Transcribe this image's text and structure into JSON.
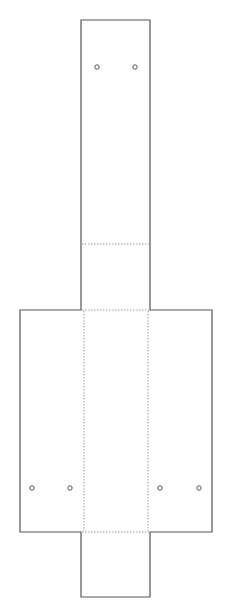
{
  "canvas": {
    "width": 234,
    "height": 606,
    "background": "#ffffff"
  },
  "colors": {
    "cut_line": "#555555",
    "fold_line": "#9a9a9a",
    "hole": "#555555"
  },
  "diagram": {
    "type": "dieline-template",
    "outline_cut_path": [
      [
        81,
        20
      ],
      [
        150,
        20
      ],
      [
        150,
        310
      ],
      [
        212,
        310
      ],
      [
        212,
        532
      ],
      [
        150,
        532
      ],
      [
        150,
        597
      ],
      [
        81,
        597
      ],
      [
        81,
        532
      ],
      [
        20,
        532
      ],
      [
        20,
        310
      ],
      [
        81,
        310
      ]
    ],
    "fold_lines": [
      {
        "name": "fold-top-panel",
        "x1": 82,
        "y1": 244,
        "x2": 149,
        "y2": 244
      },
      {
        "name": "fold-upper-crossbar",
        "x1": 82,
        "y1": 310,
        "x2": 149,
        "y2": 310
      },
      {
        "name": "fold-lower-crossbar",
        "x1": 82,
        "y1": 532,
        "x2": 149,
        "y2": 532
      },
      {
        "name": "fold-left-vertical",
        "x1": 84,
        "y1": 311,
        "x2": 84,
        "y2": 531
      },
      {
        "name": "fold-right-vertical",
        "x1": 148,
        "y1": 311,
        "x2": 148,
        "y2": 531
      }
    ],
    "holes": [
      {
        "name": "hole-top-left",
        "cx": 97,
        "cy": 67,
        "r": 2.2
      },
      {
        "name": "hole-top-right",
        "cx": 135,
        "cy": 67,
        "r": 2.2
      },
      {
        "name": "hole-left-flap-outer",
        "cx": 32,
        "cy": 488,
        "r": 2.2
      },
      {
        "name": "hole-left-flap-inner",
        "cx": 70,
        "cy": 488,
        "r": 2.2
      },
      {
        "name": "hole-right-flap-inner",
        "cx": 160,
        "cy": 488,
        "r": 2.2
      },
      {
        "name": "hole-right-flap-outer",
        "cx": 199,
        "cy": 488,
        "r": 2.2
      }
    ]
  }
}
